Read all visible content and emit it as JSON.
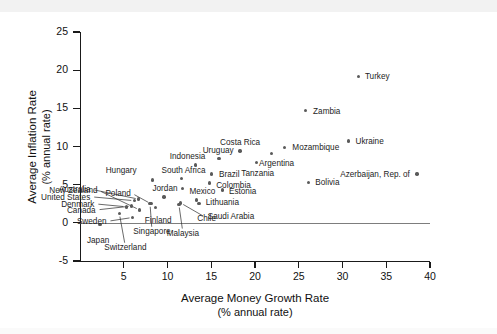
{
  "chart_data": {
    "type": "scatter",
    "title": "",
    "xlabel": "Average Money Growth Rate",
    "xlabel_sub": "(% annual rate)",
    "ylabel": "Average Inflation Rate",
    "ylabel_sub": "(% annual rate)",
    "xlim": [
      0,
      40
    ],
    "ylim": [
      -5,
      25
    ],
    "xticks": [
      5,
      10,
      15,
      20,
      25,
      30,
      35,
      40
    ],
    "xticklabels": [
      "5",
      "10",
      "15",
      "20",
      "25",
      "30",
      "35",
      "40"
    ],
    "yticks": [
      -5,
      0,
      5,
      10,
      15,
      20,
      25
    ],
    "yticklabels": [
      "-5",
      "0",
      "5",
      "10",
      "15",
      "20",
      "25"
    ],
    "grid": false,
    "legend": null,
    "zero_reference_line": 0,
    "points": [
      {
        "name": "Japan",
        "x": 2.3,
        "y": -0.2,
        "label_dx": -2,
        "label_dy": 16,
        "anchor": "c",
        "leader": false
      },
      {
        "name": "Switzerland",
        "x": 4.5,
        "y": 1.2,
        "label_dx": 6,
        "label_dy": 33,
        "anchor": "c",
        "leader": true
      },
      {
        "name": "Denmark",
        "x": 5.3,
        "y": 2.1,
        "label_dx": -32,
        "label_dy": -3,
        "anchor": "r",
        "leader": true
      },
      {
        "name": "Sweden",
        "x": 6.0,
        "y": 0.7,
        "label_dx": -26,
        "label_dy": 4,
        "anchor": "r",
        "leader": true
      },
      {
        "name": "Canada",
        "x": 5.9,
        "y": 2.2,
        "label_dx": -36,
        "label_dy": 4,
        "anchor": "r",
        "leader": true
      },
      {
        "name": "United States",
        "x": 6.2,
        "y": 2.9,
        "label_dx": -44,
        "label_dy": -4,
        "anchor": "r",
        "leader": true
      },
      {
        "name": "Australia",
        "x": 6.7,
        "y": 3.1,
        "label_dx": -48,
        "label_dy": -10,
        "anchor": "r",
        "leader": true
      },
      {
        "name": "New Zealand",
        "x": 6.8,
        "y": 1.7,
        "label_dx": -42,
        "label_dy": -20,
        "anchor": "r",
        "leader": true
      },
      {
        "name": "Singapore",
        "x": 8.0,
        "y": 2.5,
        "label_dx": 2,
        "label_dy": 27,
        "anchor": "c",
        "leader": true
      },
      {
        "name": "Poland",
        "x": 8.1,
        "y": 2.5,
        "label_dx": -20,
        "label_dy": -11,
        "anchor": "r",
        "leader": true
      },
      {
        "name": "Hungary",
        "x": 8.3,
        "y": 5.6,
        "label_dx": -16,
        "label_dy": -10,
        "anchor": "r",
        "leader": false
      },
      {
        "name": "Finland",
        "x": 8.6,
        "y": 2.0,
        "label_dx": 3,
        "label_dy": 12,
        "anchor": "c",
        "leader": false
      },
      {
        "name": "Jordan",
        "x": 9.6,
        "y": 3.4,
        "label_dx": 1,
        "label_dy": -9,
        "anchor": "c",
        "leader": false
      },
      {
        "name": "Malaysia",
        "x": 11.3,
        "y": 2.4,
        "label_dx": 4,
        "label_dy": 28,
        "anchor": "c",
        "leader": true
      },
      {
        "name": "Chile",
        "x": 11.5,
        "y": 2.6,
        "label_dx": 26,
        "label_dy": 15,
        "anchor": "c",
        "leader": true
      },
      {
        "name": "South Africa",
        "x": 11.6,
        "y": 5.8,
        "label_dx": 2,
        "label_dy": -9,
        "anchor": "c",
        "leader": false
      },
      {
        "name": "Mexico",
        "x": 11.7,
        "y": 4.5,
        "label_dx": 20,
        "label_dy": 3,
        "anchor": "c",
        "leader": false
      },
      {
        "name": "Indonesia",
        "x": 13.2,
        "y": 7.6,
        "label_dx": -8,
        "label_dy": -9,
        "anchor": "c",
        "leader": false
      },
      {
        "name": "Lithuania",
        "x": 13.3,
        "y": 3.0,
        "label_dx": 26,
        "label_dy": 2,
        "anchor": "c",
        "leader": false
      },
      {
        "name": "Saudi Arabia",
        "x": 13.6,
        "y": 2.5,
        "label_dx": 32,
        "label_dy": 12,
        "anchor": "c",
        "leader": false
      },
      {
        "name": "Colombia",
        "x": 14.8,
        "y": 5.2,
        "label_dx": 24,
        "label_dy": 2,
        "anchor": "c",
        "leader": false
      },
      {
        "name": "Brazil",
        "x": 15.0,
        "y": 6.4,
        "label_dx": 18,
        "label_dy": 0,
        "anchor": "c",
        "leader": false
      },
      {
        "name": "Uruguay",
        "x": 15.9,
        "y": 8.4,
        "label_dx": -1,
        "label_dy": -9,
        "anchor": "c",
        "leader": false
      },
      {
        "name": "Estonia",
        "x": 16.3,
        "y": 4.3,
        "label_dx": 20,
        "label_dy": 1,
        "anchor": "c",
        "leader": false
      },
      {
        "name": "Costa Rica",
        "x": 18.3,
        "y": 9.4,
        "label_dx": 0,
        "label_dy": -9,
        "anchor": "c",
        "leader": false
      },
      {
        "name": "Tanzania",
        "x": 20.2,
        "y": 7.9,
        "label_dx": 1,
        "label_dy": 10,
        "anchor": "c",
        "leader": false
      },
      {
        "name": "Argentina",
        "x": 21.9,
        "y": 9.1,
        "label_dx": 5,
        "label_dy": 10,
        "anchor": "c",
        "leader": false
      },
      {
        "name": "Mozambique",
        "x": 23.4,
        "y": 9.9,
        "label_dx": 31,
        "label_dy": 0,
        "anchor": "c",
        "leader": false
      },
      {
        "name": "Zambia",
        "x": 25.8,
        "y": 14.7,
        "label_dx": 21,
        "label_dy": 0,
        "anchor": "c",
        "leader": false
      },
      {
        "name": "Bolivia",
        "x": 26.1,
        "y": 5.3,
        "label_dx": 19,
        "label_dy": 0,
        "anchor": "c",
        "leader": false
      },
      {
        "name": "Ukraine",
        "x": 30.7,
        "y": 10.7,
        "label_dx": 21,
        "label_dy": 0,
        "anchor": "c",
        "leader": false
      },
      {
        "name": "Turkey",
        "x": 31.8,
        "y": 19.2,
        "label_dx": 19,
        "label_dy": 0,
        "anchor": "c",
        "leader": false
      },
      {
        "name": "Azerbaijan, Rep. of",
        "x": 38.5,
        "y": 6.4,
        "label_dx": -7,
        "label_dy": 0,
        "anchor": "r",
        "leader": false
      }
    ]
  }
}
